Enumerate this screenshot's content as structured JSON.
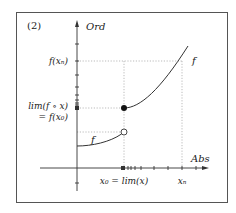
{
  "figure": {
    "label": "(2)",
    "y_axis_label": "Ord",
    "x_axis_label": "Abs",
    "curve_label_lower": "f",
    "curve_label_upper": "f",
    "y_tick_labels": {
      "f_xn": "f(xₙ)",
      "lim_line1": "lim(f ∘ x)",
      "lim_line2": "= f(x₀)"
    },
    "x_tick_labels": {
      "x0": "x₀ = lim(x)",
      "xn": "xₙ"
    },
    "points": {
      "filled": "f(x₀) — limit value (filled dot)",
      "open": "left-hand limit (open circle)"
    },
    "colors": {
      "frame": "#555555",
      "axis": "#333333",
      "curve": "#333333",
      "guide": "#aaaaaa",
      "text": "#222222"
    }
  }
}
